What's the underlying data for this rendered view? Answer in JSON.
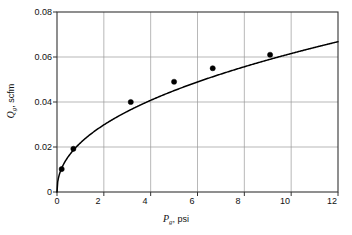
{
  "chart_data": {
    "type": "line",
    "title": "",
    "subtitle": "",
    "xlabel_symbol": "P",
    "xlabel_subscript": "g",
    "xlabel_units": ", psi",
    "xlabel": "Pg, psi",
    "ylabel_symbol": "Q",
    "ylabel_subscript": "g",
    "ylabel_units": ", scfm",
    "ylabel": "Qg, scfm",
    "xlim": [
      0,
      12
    ],
    "ylim": [
      0,
      0.08
    ],
    "xticks": [
      0,
      2,
      4,
      6,
      8,
      10,
      12
    ],
    "xtick_labels": [
      "0",
      "2",
      "4",
      "6",
      "8",
      "10",
      "12"
    ],
    "yticks": [
      0,
      0.02,
      0.04,
      0.06,
      0.08
    ],
    "ytick_labels": [
      "0",
      "0.02",
      "0.04",
      "0.06",
      "0.08"
    ],
    "grid": true,
    "grid_color": "#999999",
    "legend": null,
    "legend_position": "none",
    "series": [
      {
        "name": "fitted curve",
        "type": "line",
        "color": "#000000",
        "x": [
          0,
          0.1,
          0.2,
          0.3,
          0.45,
          0.6,
          0.8,
          1.0,
          1.3,
          1.6,
          2.0,
          2.4,
          2.8,
          3.15,
          3.6,
          4.0,
          4.5,
          5.0,
          5.5,
          6.0,
          6.65,
          7.2,
          7.8,
          8.4,
          9.1,
          9.8,
          10.5,
          11.2,
          12.0
        ],
        "y": [
          0.0,
          0.0072,
          0.0102,
          0.0124,
          0.015,
          0.0172,
          0.0196,
          0.0216,
          0.0243,
          0.0266,
          0.0292,
          0.0314,
          0.0334,
          0.04,
          0.0372,
          0.0388,
          0.0408,
          0.049,
          0.0439,
          0.0452,
          0.055,
          0.0487,
          0.0503,
          0.0518,
          0.061,
          0.0549,
          0.0563,
          0.0577,
          0.0668
        ]
      },
      {
        "name": "measured data",
        "type": "scatter",
        "marker": "filled-circle",
        "color": "#000000",
        "points": [
          {
            "x": 0.2,
            "y": 0.0102
          },
          {
            "x": 0.7,
            "y": 0.0192
          },
          {
            "x": 3.15,
            "y": 0.04
          },
          {
            "x": 5.0,
            "y": 0.049
          },
          {
            "x": 6.65,
            "y": 0.055
          },
          {
            "x": 9.1,
            "y": 0.061
          }
        ]
      }
    ],
    "curve_model": "Q = 0.0668 * (P/12)^0.45 (saturating power-law fit through data)",
    "curve_endpoint_value": 0.0668
  },
  "figure": {
    "background_color": "#ffffff",
    "frame_color": "#333333",
    "line_color": "#000000",
    "marker_color": "#000000"
  }
}
